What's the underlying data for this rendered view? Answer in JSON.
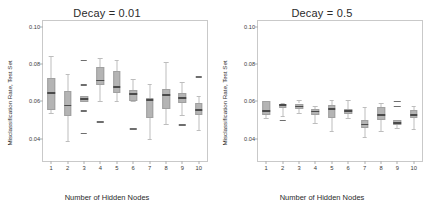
{
  "chart_data": {
    "type": "box",
    "xlabel": "Number of Hidden Nodes",
    "ylabel": "Misclassification Rate, Test Set",
    "categories": [
      "1",
      "2",
      "3",
      "4",
      "5",
      "6",
      "7",
      "8",
      "9",
      "10"
    ],
    "ylim": [
      0.028,
      0.103
    ],
    "yticks": [
      "0.04",
      "0.06",
      "0.08",
      "0.10"
    ],
    "ytickvalues": [
      0.04,
      0.06,
      0.08,
      0.1
    ],
    "grid": false,
    "legend": null,
    "colors": {
      "box_fill": "#b4b4b4",
      "box_edge": "#a0a0a0",
      "median": "#4a4a4a",
      "whisker": "#bdbdbd",
      "outlier": "#6e6e6e",
      "frame": "#c9c9c9",
      "text": "#2b2b2b"
    },
    "panels": [
      {
        "title": "Decay = 0.01",
        "boxes": [
          {
            "category": "1",
            "whisker_low": 0.0538,
            "q1": 0.0552,
            "median": 0.0645,
            "q3": 0.0725,
            "whisker_high": 0.084,
            "outliers": []
          },
          {
            "category": "2",
            "whisker_low": 0.0385,
            "q1": 0.052,
            "median": 0.0578,
            "q3": 0.0655,
            "whisker_high": 0.0748,
            "outliers": []
          },
          {
            "category": "3",
            "whisker_low": 0.06,
            "q1": 0.0598,
            "median": 0.0612,
            "q3": 0.0628,
            "whisker_high": 0.0628,
            "outliers": [
              0.0818,
              0.0688,
              0.0548,
              0.0428
            ]
          },
          {
            "category": "4",
            "whisker_low": 0.06,
            "q1": 0.0688,
            "median": 0.0712,
            "q3": 0.0782,
            "whisker_high": 0.083,
            "outliers": [
              0.0488
            ]
          },
          {
            "category": "5",
            "whisker_low": 0.06,
            "q1": 0.0645,
            "median": 0.0678,
            "q3": 0.076,
            "whisker_high": 0.0822,
            "outliers": []
          },
          {
            "category": "6",
            "whisker_low": 0.06,
            "q1": 0.0602,
            "median": 0.0638,
            "q3": 0.0658,
            "whisker_high": 0.0718,
            "outliers": [
              0.0452
            ]
          },
          {
            "category": "7",
            "whisker_low": 0.0398,
            "q1": 0.051,
            "median": 0.0608,
            "q3": 0.0618,
            "whisker_high": 0.0692,
            "outliers": []
          },
          {
            "category": "8",
            "whisker_low": 0.0478,
            "q1": 0.056,
            "median": 0.0632,
            "q3": 0.0668,
            "whisker_high": 0.0812,
            "outliers": []
          },
          {
            "category": "9",
            "whisker_low": 0.0528,
            "q1": 0.0592,
            "median": 0.0618,
            "q3": 0.0645,
            "whisker_high": 0.0702,
            "outliers": [
              0.0472
            ]
          },
          {
            "category": "10",
            "whisker_low": 0.0448,
            "q1": 0.0528,
            "median": 0.0552,
            "q3": 0.0592,
            "whisker_high": 0.0628,
            "outliers": [
              0.073
            ]
          }
        ]
      },
      {
        "title": "Decay = 0.5",
        "boxes": [
          {
            "category": "1",
            "whisker_low": 0.0512,
            "q1": 0.0528,
            "median": 0.0548,
            "q3": 0.06,
            "whisker_high": 0.06,
            "outliers": []
          },
          {
            "category": "2",
            "whisker_low": 0.0522,
            "q1": 0.0565,
            "median": 0.058,
            "q3": 0.0588,
            "whisker_high": 0.0592,
            "outliers": [
              0.0498
            ]
          },
          {
            "category": "3",
            "whisker_low": 0.0538,
            "q1": 0.0558,
            "median": 0.0572,
            "q3": 0.0588,
            "whisker_high": 0.0608,
            "outliers": []
          },
          {
            "category": "4",
            "whisker_low": 0.0482,
            "q1": 0.0528,
            "median": 0.0545,
            "q3": 0.0558,
            "whisker_high": 0.0572,
            "outliers": []
          },
          {
            "category": "5",
            "whisker_low": 0.0442,
            "q1": 0.0512,
            "median": 0.0558,
            "q3": 0.0582,
            "whisker_high": 0.0608,
            "outliers": []
          },
          {
            "category": "6",
            "whisker_low": 0.0512,
            "q1": 0.0532,
            "median": 0.0548,
            "q3": 0.0558,
            "whisker_high": 0.0608,
            "outliers": []
          },
          {
            "category": "7",
            "whisker_low": 0.0408,
            "q1": 0.0458,
            "median": 0.0475,
            "q3": 0.05,
            "whisker_high": 0.057,
            "outliers": []
          },
          {
            "category": "8",
            "whisker_low": 0.0442,
            "q1": 0.0498,
            "median": 0.0528,
            "q3": 0.0568,
            "whisker_high": 0.0592,
            "outliers": []
          },
          {
            "category": "9",
            "whisker_low": 0.0458,
            "q1": 0.0472,
            "median": 0.0482,
            "q3": 0.0498,
            "whisker_high": 0.0502,
            "outliers": [
              0.0598,
              0.0572
            ]
          },
          {
            "category": "10",
            "whisker_low": 0.0452,
            "q1": 0.0512,
            "median": 0.0528,
            "q3": 0.0552,
            "whisker_high": 0.0575,
            "outliers": []
          }
        ]
      }
    ]
  }
}
